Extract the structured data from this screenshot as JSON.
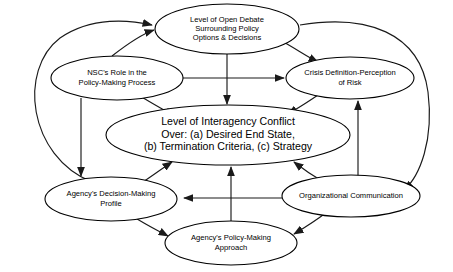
{
  "diagram": {
    "background_color": "#ffffff",
    "line_color": "#1a1a1a",
    "node_fill": "#ffffff",
    "nodes": [
      {
        "id": "open-debate",
        "lines": [
          "Level of Open Debate",
          "Surrounding Policy",
          "Options & Decisions"
        ],
        "cx": 227,
        "cy": 29,
        "rx": 72,
        "ry": 25,
        "size": "sm"
      },
      {
        "id": "nsc-role",
        "lines": [
          "NSC's Role in the",
          "Policy-Making Process"
        ],
        "cx": 117,
        "cy": 78,
        "rx": 66,
        "ry": 22,
        "size": "sm"
      },
      {
        "id": "crisis-definition",
        "lines": [
          "Crisis Definition-Perception",
          "of Risk"
        ],
        "cx": 350,
        "cy": 78,
        "rx": 64,
        "ry": 21,
        "size": "sm"
      },
      {
        "id": "interagency-conflict",
        "lines": [
          "Level of Interagency Conflict",
          "Over: (a) Desired End State,",
          "(b) Termination Criteria, (c) Strategy"
        ],
        "cx": 228,
        "cy": 135,
        "rx": 122,
        "ry": 30,
        "size": "md"
      },
      {
        "id": "agency-decision-profile",
        "lines": [
          "Agency's Decision-Making",
          "Profile"
        ],
        "cx": 111,
        "cy": 199,
        "rx": 66,
        "ry": 22,
        "size": "sm"
      },
      {
        "id": "organizational-communication",
        "lines": [
          "Organizational Communication"
        ],
        "cx": 351,
        "cy": 196,
        "rx": 69,
        "ry": 21,
        "size": "sm"
      },
      {
        "id": "agency-policy-approach",
        "lines": [
          "Agency's Policy-Making",
          "Approach"
        ],
        "cx": 231,
        "cy": 243,
        "rx": 66,
        "ry": 22,
        "size": "sm"
      }
    ],
    "edges": [
      {
        "id": "nsc-to-open-debate",
        "from": "nsc-role",
        "to": "open-debate",
        "path": "M 112,56 C 130,42 142,34 154,30"
      },
      {
        "id": "profile-to-open-debate-left-curve",
        "from": "agency-decision-profile",
        "to": "open-debate",
        "path": "M 92,182 C 28,156 18,70 60,38 C 92,16 130,20 152,25"
      },
      {
        "id": "open-debate-to-crisis",
        "from": "open-debate",
        "to": "crisis-definition",
        "path": "M 280,40 C 298,50 306,56 318,62"
      },
      {
        "id": "open-debate-to-conflict",
        "from": "open-debate",
        "to": "interagency-conflict",
        "path": "M 227,54 L 227,104"
      },
      {
        "id": "nsc-to-crisis",
        "from": "nsc-role",
        "to": "crisis-definition",
        "path": "M 183,78 L 284,78"
      },
      {
        "id": "nsc-to-conflict",
        "from": "nsc-role",
        "to": "interagency-conflict",
        "path": "M 140,96 C 155,105 164,110 174,116"
      },
      {
        "id": "nsc-to-profile",
        "from": "nsc-role",
        "to": "agency-decision-profile",
        "path": "M 81,98 L 81,176"
      },
      {
        "id": "crisis-to-conflict",
        "from": "crisis-definition",
        "to": "interagency-conflict",
        "path": "M 318,95 C 305,104 298,108 288,114"
      },
      {
        "id": "orgcomm-to-crisis",
        "from": "organizational-communication",
        "to": "crisis-definition",
        "path": "M 358,176 L 358,101"
      },
      {
        "id": "orgcomm-to-open-debate-right-curve",
        "from": "open-debate",
        "to": "organizational-communication",
        "path": "M 300,25 C 366,14 420,32 428,92 C 434,140 420,176 404,190"
      },
      {
        "id": "profile-to-conflict",
        "from": "agency-decision-profile",
        "to": "interagency-conflict",
        "path": "M 140,184 C 152,176 160,170 172,162"
      },
      {
        "id": "orgcomm-to-conflict",
        "from": "organizational-communication",
        "to": "interagency-conflict",
        "path": "M 322,181 C 310,174 303,169 294,162"
      },
      {
        "id": "orgcomm-to-profile",
        "from": "organizational-communication",
        "to": "agency-decision-profile",
        "path": "M 282,198 L 184,198"
      },
      {
        "id": "approach-to-conflict",
        "from": "agency-policy-approach",
        "to": "interagency-conflict",
        "path": "M 231,221 L 231,167"
      },
      {
        "id": "profile-to-approach",
        "from": "agency-decision-profile",
        "to": "agency-policy-approach",
        "path": "M 134,217 C 148,226 157,230 168,236"
      },
      {
        "id": "orgcomm-to-approach",
        "from": "organizational-communication",
        "to": "agency-policy-approach",
        "path": "M 327,212 C 314,222 304,228 294,234"
      }
    ]
  }
}
